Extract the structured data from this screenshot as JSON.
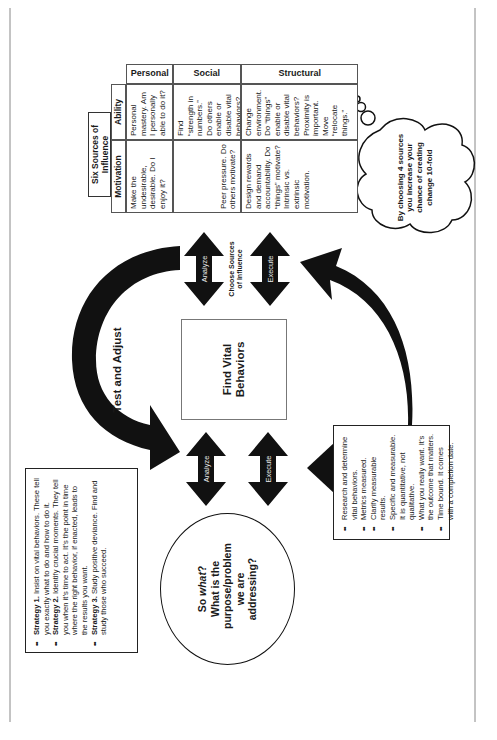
{
  "page": {
    "orientation": "rotated 90 degrees counter-clockwise"
  },
  "table": {
    "title": "Six Sources of Influence",
    "columns": [
      "Motivation",
      "Ability"
    ],
    "rows": [
      {
        "label": "Personal",
        "motivation": "Make the undesirable, desirable. Do I enjoy it?",
        "ability": "Personal mastery. Am I personally able to do it?"
      },
      {
        "label": "Social",
        "motivation": "Peer pressure. Do others motivate?",
        "ability": "Find “strength in numbers.” Do others enable or disable vital behaviors?"
      },
      {
        "label": "Structural",
        "motivation": "Design rewards and demand accountability. Do “things” motivate? Intrinsic vs. extrinsic motivation.",
        "ability": "Change environment. Do “things” enable or disable vital behaviors? Proximity is important. Move “relocate things.”"
      }
    ]
  },
  "cloud": {
    "text": "By choosing 4 sources you increase your chance of creating change 10-fold"
  },
  "top_arrows": {
    "analyze": "Analyze",
    "choose_sources": "Choose Sources of Influence",
    "execute": "Execute"
  },
  "center": {
    "title": "Find Vital Behaviors"
  },
  "cycle": {
    "label": "Test and Adjust"
  },
  "bottom_arrows": {
    "analyze": "Analyze",
    "execute": "Execute"
  },
  "circle": {
    "line1_prefix": "So ",
    "line1_em": "what",
    "line1_suffix": "?",
    "rest": "What is the purpose/problem we are addressing?"
  },
  "strategies": [
    {
      "label": "Strategy 1.",
      "text": " Insist on vital behaviors. These tell you exactly what to do and how to do it."
    },
    {
      "label": "Strategy 2.",
      "text": " Identify crucial moments. They tell you when it’s time to act. It’s the point in time where the right behavior, if enacted, leads to the results you want."
    },
    {
      "label": "Strategy 3.",
      "text": " Study positive deviance. Find and study those who succeed."
    }
  ],
  "measures": [
    "Research and determine vital behaviors.",
    "Metrics measured.",
    "Clarify measurable results.",
    "Specific and measurable. It is quantitative, not qualitative.",
    "What you really want. It’s the outcome that matters.",
    "Time bound. It comes with a completion date."
  ],
  "colors": {
    "ink": "#111111",
    "rule": "#888888",
    "arrow_label": "#e8e8e8"
  }
}
